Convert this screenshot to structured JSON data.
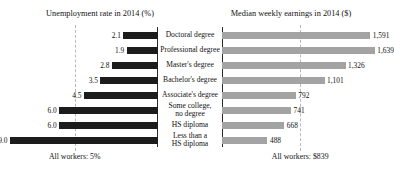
{
  "chart_data": {
    "type": "bar",
    "title": "",
    "orientation": "horizontal",
    "layout": "paired-diverging-panels",
    "categories": [
      "Doctoral degree",
      "Professional degree",
      "Master's degree",
      "Bachelor's degree",
      "Associate's degree",
      "Some college, no degree",
      "HS diploma",
      "Less than a HS diploma"
    ],
    "category_lines": [
      [
        "Doctoral degree"
      ],
      [
        "Professional degree"
      ],
      [
        "Master's degree"
      ],
      [
        "Bachelor's degree"
      ],
      [
        "Associate's degree"
      ],
      [
        "Some college,",
        "no degree"
      ],
      [
        "HS diploma"
      ],
      [
        "Less than a",
        "HS diploma"
      ]
    ],
    "panels": [
      {
        "id": "unemployment",
        "title": "Unemployment rate in 2014 (%)",
        "side": "left",
        "direction": "rtl",
        "unit": "%",
        "values": [
          2.1,
          1.9,
          2.8,
          3.5,
          4.5,
          6.0,
          6.0,
          9.0
        ],
        "value_labels": [
          "2.1",
          "1.9",
          "2.8",
          "3.5",
          "4.5",
          "6.0",
          "6.0",
          "9.0"
        ],
        "xlim": [
          0,
          9.6
        ],
        "bar_color": "#1c1c1c",
        "reference_line": {
          "value": 5.0,
          "label": "All workers: 5%",
          "style": "dashed",
          "color": "#b9b9b9"
        }
      },
      {
        "id": "earnings",
        "title": "Median weekly earnings in 2014 ($)",
        "side": "right",
        "direction": "ltr",
        "unit": "$",
        "values": [
          1591,
          1639,
          1326,
          1101,
          792,
          741,
          668,
          488
        ],
        "value_labels": [
          "1,591",
          "1,639",
          "1,326",
          "1,101",
          "792",
          "741",
          "668",
          "488"
        ],
        "xlim": [
          0,
          1760
        ],
        "bar_color": "#a3a3a3",
        "reference_line": {
          "value": 839,
          "label": "All workers: $839",
          "style": "dashed",
          "color": "#b9b9b9"
        }
      }
    ],
    "grid": false,
    "legend": "none",
    "axis_spine_color": "#2a2a2a"
  },
  "titles": {
    "left": "Unemployment rate in 2014 (%)",
    "right": "Median weekly earnings in 2014 ($)"
  },
  "footnotes": {
    "left": "All workers: 5%",
    "right": "All workers: $839"
  }
}
